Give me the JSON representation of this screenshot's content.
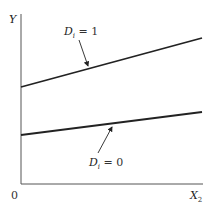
{
  "diagram": {
    "axes": {
      "y_label": "Y",
      "x_label_main": "X",
      "x_label_sub": "2",
      "origin_label": "0"
    },
    "lines": [
      {
        "name": "D_i = 1",
        "label_main": "D",
        "label_sub": "i",
        "label_rest": " = 1",
        "x1": 21,
        "y1": 87,
        "x2": 202,
        "y2": 38
      },
      {
        "name": "D_i = 0",
        "label_main": "D",
        "label_sub": "i",
        "label_rest": " = 0",
        "x1": 21,
        "y1": 135,
        "x2": 202,
        "y2": 112
      }
    ],
    "colors": {
      "line": "#222222",
      "axis": "#555555"
    }
  }
}
